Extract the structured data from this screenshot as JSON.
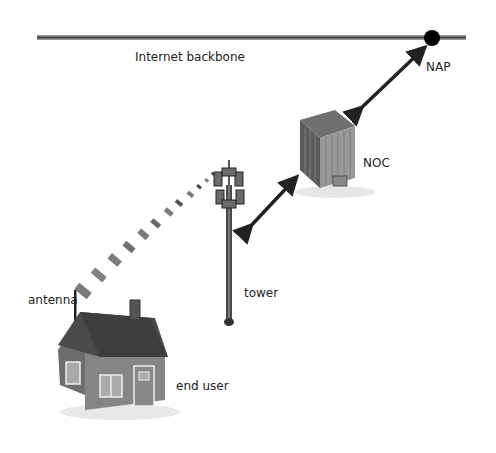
{
  "diagram": {
    "labels": {
      "backbone": "Internet backbone",
      "nap": "NAP",
      "noc": "NOC",
      "tower": "tower",
      "antenna": "antenna",
      "end_user": "end user"
    },
    "colors": {
      "line": "#555555",
      "arrow": "#222222",
      "building": "#888888",
      "roof": "#4a4a4a",
      "signal": "#7a7a7a"
    }
  }
}
